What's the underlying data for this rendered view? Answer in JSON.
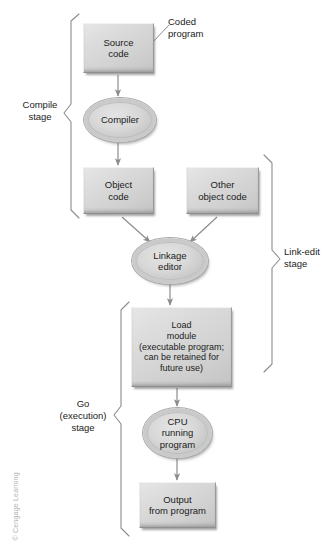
{
  "figure": {
    "credit": "© Cengage Learning"
  },
  "nodes": [
    {
      "id": "source-code",
      "shape": "box",
      "label": "Source\ncode"
    },
    {
      "id": "compiler",
      "shape": "ellipse",
      "label": "Compiler"
    },
    {
      "id": "object-code",
      "shape": "box",
      "label": "Object\ncode"
    },
    {
      "id": "other-object-code",
      "shape": "box",
      "label": "Other\nobject code"
    },
    {
      "id": "linkage-editor",
      "shape": "ellipse",
      "label": "Linkage\neditor"
    },
    {
      "id": "load-module",
      "shape": "box",
      "label": "Load\nmodule\n(executable program;\ncan be retained for\nfuture use)"
    },
    {
      "id": "cpu-running",
      "shape": "ellipse",
      "label": "CPU\nrunning\nprogram"
    },
    {
      "id": "output",
      "shape": "box",
      "label": "Output\nfrom program"
    }
  ],
  "annotations": [
    {
      "id": "coded-program",
      "label": "Coded\nprogram"
    }
  ],
  "stages": [
    {
      "id": "compile",
      "label": "Compile\nstage",
      "side": "left"
    },
    {
      "id": "link-edit",
      "label": "Link-edit\nstage",
      "side": "right"
    },
    {
      "id": "go",
      "label": "Go\n(execution)\nstage",
      "side": "left"
    }
  ],
  "flows": [
    {
      "from": "source-code",
      "to": "compiler"
    },
    {
      "from": "compiler",
      "to": "object-code"
    },
    {
      "from": "object-code",
      "to": "linkage-editor"
    },
    {
      "from": "other-object-code",
      "to": "linkage-editor"
    },
    {
      "from": "linkage-editor",
      "to": "load-module"
    },
    {
      "from": "load-module",
      "to": "cpu-running"
    },
    {
      "from": "cpu-running",
      "to": "output"
    }
  ],
  "colors": {
    "shape_fill": "#d8d8d8",
    "shape_stroke": "#9a9a9a",
    "connector": "#8c8c8c",
    "brace": "#8c8c8c",
    "text": "#1b1b1b",
    "credit_text": "#b3b3b3",
    "background": "#ffffff"
  }
}
